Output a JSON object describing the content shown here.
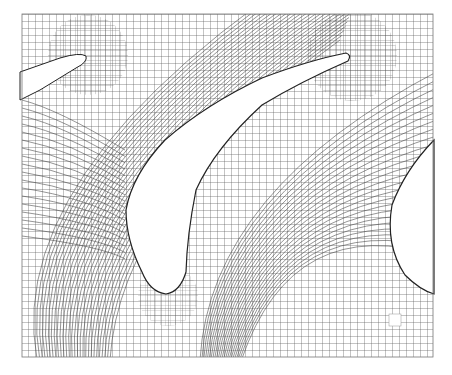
{
  "figure": {
    "type": "structured-mesh",
    "background": "#ffffff",
    "mesh_color": "#3a3a3a",
    "domain_box": {
      "x": 22,
      "y": 14,
      "width": 411,
      "height": 343
    },
    "blades": [
      {
        "name": "left-blade-partial",
        "tip": [
          84,
          57
        ]
      },
      {
        "name": "center-blade",
        "tip": [
          348,
          58
        ],
        "bottom": [
          168,
          293
        ]
      },
      {
        "name": "right-blade-partial"
      }
    ],
    "marker": {
      "x": 389,
      "y": 314,
      "size": 12
    }
  }
}
